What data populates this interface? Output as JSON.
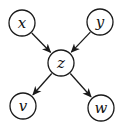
{
  "diagram": {
    "type": "directed-graph",
    "background_color": "#ffffff",
    "stroke_color": "#1a1a1a",
    "node_fill_color": "#ffffff",
    "label_color": "#111111",
    "nodes": [
      {
        "id": "x",
        "label": "x",
        "x": 22,
        "y": 23,
        "r": 13
      },
      {
        "id": "y",
        "label": "y",
        "x": 100,
        "y": 22,
        "r": 13
      },
      {
        "id": "z",
        "label": "z",
        "x": 61,
        "y": 63,
        "r": 13
      },
      {
        "id": "v",
        "label": "v",
        "x": 23,
        "y": 106,
        "r": 13
      },
      {
        "id": "w",
        "label": "w",
        "x": 101,
        "y": 108,
        "r": 13
      }
    ],
    "edges": [
      {
        "from": "x",
        "to": "z"
      },
      {
        "from": "y",
        "to": "z"
      },
      {
        "from": "z",
        "to": "v"
      },
      {
        "from": "z",
        "to": "w"
      }
    ]
  }
}
